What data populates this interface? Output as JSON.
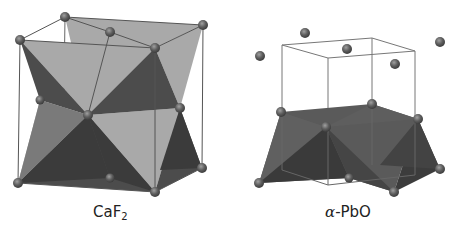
{
  "figure": {
    "panels": [
      {
        "id": "caf2",
        "label_main": "CaF",
        "label_sub": "2",
        "description": "Fluorite structure with edge-sharing tetrahedra in cubic unit cell"
      },
      {
        "id": "pbo",
        "label_greek": "α",
        "label_rest": "-PbO",
        "description": "Litharge (alpha-PbO) layered structure with square-pyramidal layer below unit cell"
      }
    ],
    "colors": {
      "background": "#ffffff",
      "light_face": "#a9a9a9",
      "mid_face": "#6a6a6a",
      "dark_face": "#474747",
      "darkest_face": "#383838",
      "edge_line": "#555555",
      "atom": "#5e5e5e",
      "atom_highlight": "#9a9a9a"
    }
  }
}
